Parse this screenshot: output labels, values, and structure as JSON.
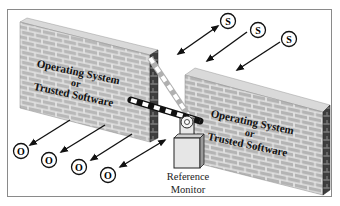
{
  "diagram": {
    "type": "reference-monitor-illustration",
    "left_wall": {
      "label_line1": "Operating System",
      "label_line2": "or",
      "label_line3": "Trusted Software"
    },
    "right_wall": {
      "label_line1": "Operating System",
      "label_line2": "or",
      "label_line3": "Trusted Software"
    },
    "gate": {
      "label_line1": "Reference",
      "label_line2": "Monitor"
    },
    "subjects": [
      {
        "symbol": "S"
      },
      {
        "symbol": "S"
      },
      {
        "symbol": "S"
      }
    ],
    "objects": [
      {
        "symbol": "O"
      },
      {
        "symbol": "O"
      },
      {
        "symbol": "O"
      },
      {
        "symbol": "O"
      }
    ],
    "colors": {
      "brick_face": "#b8b8b8",
      "mortar": "#e6e6e6",
      "wall_side": "#4a4a4a",
      "wall_top": "#d6d6d6",
      "arrow": "#111111",
      "frame_border": "#8a8a8a"
    }
  }
}
